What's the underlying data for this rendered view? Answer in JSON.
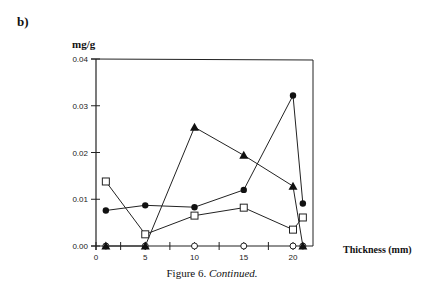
{
  "panel_label": "b)",
  "caption": {
    "prefix": "Figure 6. ",
    "italic": "Continued."
  },
  "chart_data": {
    "type": "line",
    "title": "",
    "xlabel": "Thickness (mm)",
    "ylabel": "mg/g",
    "xlim": [
      0,
      22
    ],
    "ylim": [
      0,
      0.04
    ],
    "x_ticks": [
      0,
      5,
      10,
      15,
      20
    ],
    "x_tick_labels": [
      "0",
      "5",
      "10",
      "15",
      "20"
    ],
    "y_ticks": [
      0.0,
      0.01,
      0.02,
      0.03,
      0.04
    ],
    "y_tick_labels": [
      "0.00",
      "0.01",
      "0.02",
      "0.03",
      "0.04"
    ],
    "grid": false,
    "legend": null,
    "series": [
      {
        "name": "open-square",
        "marker": "open-square",
        "x": [
          1,
          5,
          10,
          15,
          20,
          21
        ],
        "values": [
          0.0138,
          0.0025,
          0.0065,
          0.0082,
          0.0035,
          0.0061
        ]
      },
      {
        "name": "filled-circle",
        "marker": "filled-circle",
        "x": [
          1,
          5,
          10,
          15,
          20,
          21
        ],
        "values": [
          0.0076,
          0.0087,
          0.0083,
          0.012,
          0.0322,
          0.0091
        ]
      },
      {
        "name": "filled-triangle",
        "marker": "filled-triangle",
        "x": [
          1,
          5,
          10,
          15,
          20,
          21
        ],
        "values": [
          0.0,
          0.0,
          0.0254,
          0.0194,
          0.0128,
          0.0
        ]
      },
      {
        "name": "open-diamond",
        "marker": "open-diamond",
        "x": [
          1,
          5,
          10,
          15,
          20,
          21
        ],
        "values": [
          0.0,
          0.0,
          0.0,
          0.0,
          0.0,
          0.0
        ]
      }
    ]
  }
}
